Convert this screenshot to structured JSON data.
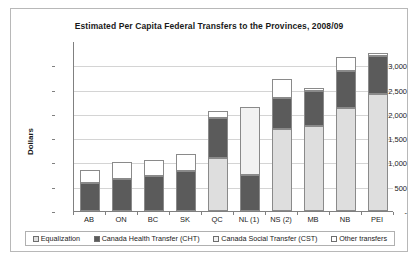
{
  "chart_data": {
    "type": "bar",
    "subtype": "stacked-column",
    "title": "Estimated Per Capita Federal Transfers to the Provinces, 2008/09",
    "xlabel": "",
    "ylabel": "Dollars",
    "ylim": [
      0,
      3500
    ],
    "ytick_labels": [
      "3,000",
      "2,500",
      "2,000",
      "1,500",
      "1,000",
      "500",
      "-"
    ],
    "ytick_values": [
      3000,
      2500,
      2000,
      1500,
      1000,
      500,
      0
    ],
    "grid": true,
    "legend_position": "bottom",
    "categories": [
      "AB",
      "ON",
      "BC",
      "SK",
      "QC",
      "NL (1)",
      "NS (2)",
      "MB",
      "NB",
      "PEI"
    ],
    "series": [
      {
        "name": "Equalization",
        "color": "#dedede",
        "values": [
          0,
          0,
          0,
          0,
          1100,
          0,
          1680,
          1760,
          2120,
          2400
        ]
      },
      {
        "name": "Canada Health Transfer (CHT)",
        "color": "#5b5b5b",
        "values": [
          570,
          660,
          720,
          830,
          810,
          750,
          640,
          720,
          770,
          800
        ]
      },
      {
        "name": "Canada Social Transfer (CST)",
        "color": "#f2f2f2",
        "values": [
          0,
          0,
          0,
          0,
          0,
          1400,
          0,
          0,
          0,
          0
        ]
      },
      {
        "name": "Other transfers",
        "color": "#ffffff",
        "values": [
          270,
          340,
          340,
          350,
          140,
          0,
          390,
          60,
          280,
          50
        ]
      }
    ],
    "totals": [
      840,
      1000,
      1060,
      1180,
      2050,
      2150,
      2710,
      2540,
      3170,
      3250
    ]
  },
  "legend": {
    "items": [
      {
        "label": "Equalization",
        "swatch": "#dedede"
      },
      {
        "label": "Canada Health Transfer (CHT)",
        "swatch": "#5b5b5b"
      },
      {
        "label": "Canada Social Transfer (CST)",
        "swatch": "#f2f2f2"
      },
      {
        "label": "Other transfers",
        "swatch": "#ffffff"
      }
    ]
  }
}
